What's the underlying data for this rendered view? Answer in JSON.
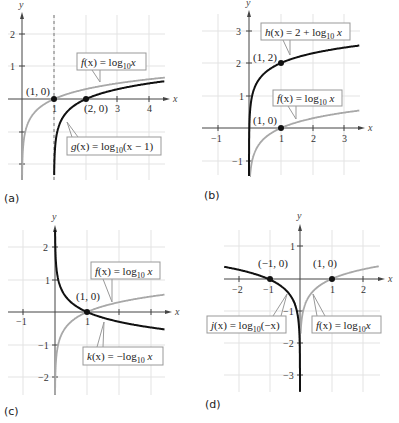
{
  "chart_data": [
    {
      "id": "a",
      "type": "line",
      "panel_label": "(a)",
      "title": "",
      "xlabel": "x",
      "ylabel": "y",
      "xlim": [
        -0.5,
        4.5
      ],
      "ylim": [
        -2.5,
        2.6
      ],
      "grid": true,
      "x_ticks": [
        "1",
        "3",
        "4"
      ],
      "y_ticks": [
        "2",
        "1"
      ],
      "asymptote": {
        "x": 1,
        "style": "dashed"
      },
      "series": [
        {
          "name": "f(x) = log10 x",
          "expr": "log10(x)",
          "color": "#a8a8a8",
          "domain": [
            0.005,
            4.5
          ]
        },
        {
          "name": "g(x) = log10(x - 1)",
          "expr": "log10(x-1)",
          "color": "#111111",
          "domain": [
            1.005,
            4.5
          ]
        }
      ],
      "points": [
        {
          "label": "(1, 0)",
          "x": 1,
          "y": 0
        },
        {
          "label": "(2, 0)",
          "x": 2,
          "y": 0
        }
      ],
      "annotations": [
        {
          "text": "f(x) = log₁₀x",
          "target_series": "f"
        },
        {
          "text": "g(x) = log₁₀(x − 1)",
          "target_series": "g"
        }
      ]
    },
    {
      "id": "b",
      "type": "line",
      "panel_label": "(b)",
      "xlabel": "x",
      "ylabel": "y",
      "xlim": [
        -1.5,
        3.5
      ],
      "ylim": [
        -1.5,
        3.6
      ],
      "grid": true,
      "x_ticks": [
        "−1",
        "1",
        "2",
        "3"
      ],
      "y_ticks": [
        "3",
        "2",
        "1",
        "−1"
      ],
      "series": [
        {
          "name": "h(x) = 2 + log10 x",
          "expr": "2+log10(x)",
          "color": "#111111",
          "domain": [
            0.0003,
            3.5
          ]
        },
        {
          "name": "f(x) = log10 x",
          "expr": "log10(x)",
          "color": "#a8a8a8",
          "domain": [
            0.03,
            3.5
          ]
        }
      ],
      "points": [
        {
          "label": "(1, 2)",
          "x": 1,
          "y": 2
        },
        {
          "label": "(1, 0)",
          "x": 1,
          "y": 0
        }
      ],
      "annotations": [
        {
          "text": "h(x) = 2 + log₁₀ x",
          "target_series": "h"
        },
        {
          "text": "f(x) = log₁₀ x",
          "target_series": "f"
        }
      ]
    },
    {
      "id": "c",
      "type": "line",
      "panel_label": "(c)",
      "xlabel": "x",
      "ylabel": "y",
      "xlim": [
        -1.5,
        3.5
      ],
      "ylim": [
        -2.5,
        2.6
      ],
      "grid": true,
      "x_ticks": [
        "−1",
        "1"
      ],
      "y_ticks": [
        "2",
        "1",
        "−1",
        "−2"
      ],
      "series": [
        {
          "name": "f(x) = log10 x",
          "expr": "log10(x)",
          "color": "#a8a8a8",
          "domain": [
            0.003,
            3.5
          ]
        },
        {
          "name": "k(x) = -log10 x",
          "expr": "-log10(x)",
          "color": "#111111",
          "domain": [
            0.003,
            3.5
          ]
        }
      ],
      "points": [
        {
          "label": "(1, 0)",
          "x": 1,
          "y": 0
        }
      ],
      "annotations": [
        {
          "text": "f(x) = log₁₀ x",
          "target_series": "f"
        },
        {
          "text": "k(x) = −log₁₀ x",
          "target_series": "k"
        }
      ]
    },
    {
      "id": "d",
      "type": "line",
      "panel_label": "(d)",
      "xlabel": "x",
      "ylabel": "y",
      "xlim": [
        -2.5,
        2.5
      ],
      "ylim": [
        -3.5,
        1.6
      ],
      "grid": true,
      "x_ticks": [
        "−2",
        "−1",
        "1",
        "2"
      ],
      "y_ticks": [
        "1",
        "−1",
        "−2",
        "−3"
      ],
      "series": [
        {
          "name": "j(x) = log10(-x)",
          "expr": "log10(-x)",
          "color": "#111111",
          "domain": [
            -2.5,
            -0.0003
          ]
        },
        {
          "name": "f(x) = log10 x",
          "expr": "log10(x)",
          "color": "#a8a8a8",
          "domain": [
            0.02,
            2.5
          ]
        }
      ],
      "points": [
        {
          "label": "(−1, 0)",
          "x": -1,
          "y": 0
        },
        {
          "label": "(1, 0)",
          "x": 1,
          "y": 0
        }
      ],
      "annotations": [
        {
          "text": "j(x) = log₁₀(−x)",
          "target_series": "j"
        },
        {
          "text": "f(x) = log₁₀x",
          "target_series": "f"
        }
      ]
    }
  ],
  "panels": {
    "a": {
      "letter": "(a)",
      "y_axis_label": "y",
      "x_axis_label": "x",
      "ticks": {
        "x1": "1",
        "x3": "3",
        "x4": "4",
        "y2": "2",
        "y1": "1"
      },
      "points": {
        "p1": "(1, 0)",
        "p2": "(2, 0)"
      },
      "labels": {
        "f": {
          "fx": "f",
          "pre": "(x) = log",
          "sub": "10",
          "post": "x"
        },
        "g": {
          "fx": "g",
          "pre": "(x) = log",
          "sub": "10",
          "post": "(x − 1)"
        }
      }
    },
    "b": {
      "letter": "(b)",
      "y_axis_label": "y",
      "x_axis_label": "x",
      "ticks": {
        "xm1": "−1",
        "x1": "1",
        "x2": "2",
        "x3": "3",
        "y3": "3",
        "y2": "2",
        "y1": "1",
        "ym1": "−1"
      },
      "points": {
        "p1": "(1, 2)",
        "p2": "(1, 0)"
      },
      "labels": {
        "h": {
          "fx": "h",
          "pre": "(x) = 2 + log",
          "sub": "10",
          "post": " x"
        },
        "f": {
          "fx": "f",
          "pre": "(x) = log",
          "sub": "10",
          "post": " x"
        }
      }
    },
    "c": {
      "letter": "(c)",
      "y_axis_label": "y",
      "x_axis_label": "x",
      "ticks": {
        "xm1": "−1",
        "x1": "1",
        "y2": "2",
        "y1": "1",
        "ym1": "−1",
        "ym2": "−2"
      },
      "points": {
        "p1": "(1, 0)"
      },
      "labels": {
        "f": {
          "fx": "f",
          "pre": "(x) = log",
          "sub": "10",
          "post": " x"
        },
        "k": {
          "fx": "k",
          "pre": "(x) = −log",
          "sub": "10",
          "post": " x"
        }
      }
    },
    "d": {
      "letter": "(d)",
      "y_axis_label": "y",
      "x_axis_label": "x",
      "ticks": {
        "xm2": "−2",
        "xm1": "−1",
        "x1": "1",
        "x2": "2",
        "y1": "1",
        "ym1": "−1",
        "ym2": "−2",
        "ym3": "−3"
      },
      "points": {
        "p1": "(−1, 0)",
        "p2": "(1, 0)"
      },
      "labels": {
        "j": {
          "fx": "j",
          "pre": "(x) = log",
          "sub": "10",
          "post": "(−x)"
        },
        "f": {
          "fx": "f",
          "pre": "(x) = log",
          "sub": "10",
          "post": "x"
        }
      }
    }
  },
  "colors": {
    "primary_curve": "#111111",
    "secondary_curve": "#a8a8a8",
    "grid": "#e3e3e3",
    "axis": "#444444"
  }
}
